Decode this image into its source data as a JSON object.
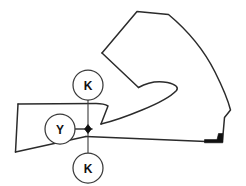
{
  "drawing": {
    "title": "Tool profile section with datum callouts",
    "width": 246,
    "height": 186,
    "background_color": "#ffffff",
    "outline_color": "#2b2b2b",
    "outline_width": 1.4,
    "fill_color": "none",
    "solid_mark_color": "#111111",
    "centerline_color": "#3a3a3a",
    "centerline_width": 1.1,
    "balloon": {
      "radius": 15,
      "stroke_color": "#3a3a3a",
      "stroke_width": 1.2,
      "fill_color": "#ffffff",
      "text_color": "#111111"
    },
    "callouts": [
      {
        "id": "callout-k-top",
        "label": "K",
        "cx": 88,
        "cy": 85,
        "leader": {
          "x1": 88,
          "y1": 100,
          "x2": 88,
          "y2": 122
        }
      },
      {
        "id": "callout-y-left",
        "label": "Y",
        "cx": 60,
        "cy": 129,
        "leader": {
          "x1": 75,
          "y1": 129,
          "x2": 86,
          "y2": 129
        }
      },
      {
        "id": "callout-k-bottom",
        "label": "K",
        "cx": 88,
        "cy": 168,
        "leader": {
          "x1": 88,
          "y1": 153,
          "x2": 88,
          "y2": 137
        }
      }
    ],
    "node_point": {
      "id": "datum-node",
      "x": 88,
      "y": 129,
      "size": 4.2,
      "shape": "diamond"
    },
    "centerlines": {
      "vertical": {
        "x": 88,
        "y1": 100,
        "y2": 153
      },
      "horizontal": {
        "y": 129,
        "x1": 75,
        "x2": 92
      }
    },
    "profile_path": "M 18,105 L 102,104 Q 122,103 134,95 L 140,87 Q 152,80 168,83 Q 180,85 177,90 Q 172,97 150,106 Q 126,117 96,128 L 88,132 L 205,141 L 222,141 L 224,118 L 230,110 Q 226,70 196,38 L 168,14 L 137,12 L 102,53 L 137,87 L 140,87 M 18,105 L 15,152 L 88,136",
    "blade_edge_path": "M 205,141 L 222,141 L 224,118",
    "solid_wedge_path": "M 206,142 L 222,142 L 222,135 L 216,135 L 216,139 L 206,139 Z"
  }
}
